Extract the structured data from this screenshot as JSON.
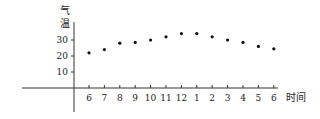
{
  "chart_data": {
    "type": "scatter",
    "title": "",
    "xlabel": "时间",
    "ylabel": "气温",
    "categories": [
      "6",
      "7",
      "8",
      "9",
      "10",
      "11",
      "12",
      "1",
      "2",
      "3",
      "4",
      "5",
      "6"
    ],
    "values": [
      22,
      24,
      28,
      28.5,
      30,
      32,
      34,
      34,
      32,
      30,
      28.5,
      26,
      24.5
    ],
    "yticks": [
      10,
      20,
      30
    ],
    "ylim": [
      0,
      35
    ],
    "grid": false,
    "legend": null
  },
  "labels": {
    "ylabel_top": "气",
    "ylabel_bottom": "温",
    "xlabel": "时间"
  },
  "yticks": [
    "30",
    "20",
    "10"
  ],
  "xticks": [
    "6",
    "7",
    "8",
    "9",
    "10",
    "11",
    "12",
    "1",
    "2",
    "3",
    "4",
    "5",
    "6"
  ]
}
